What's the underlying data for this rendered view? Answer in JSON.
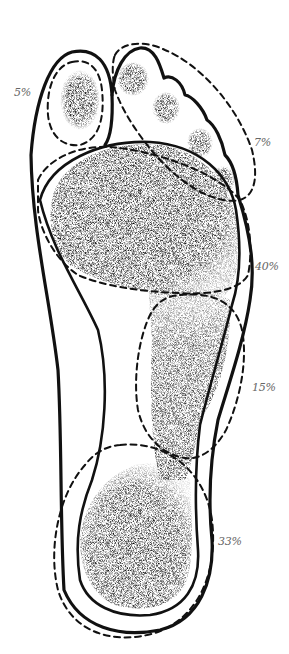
{
  "diagram": {
    "type": "plantar-pressure-distribution",
    "regions": [
      {
        "id": "hallux",
        "name": "big toe",
        "label": "5%",
        "value": 5
      },
      {
        "id": "lesser-toes",
        "name": "lesser toes",
        "label": "7%",
        "value": 7
      },
      {
        "id": "forefoot",
        "name": "ball of foot / metatarsal heads",
        "label": "40%",
        "value": 40
      },
      {
        "id": "midfoot",
        "name": "lateral midfoot",
        "label": "15%",
        "value": 15
      },
      {
        "id": "heel",
        "name": "heel",
        "label": "33%",
        "value": 33
      }
    ],
    "colors": {
      "outline": "#111111",
      "stipple": "#1a1a1a",
      "label": "#666666",
      "background": "#ffffff"
    }
  }
}
